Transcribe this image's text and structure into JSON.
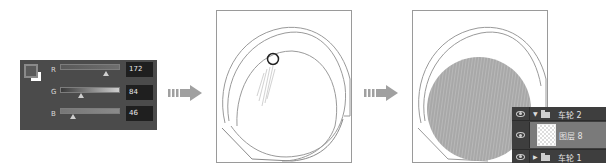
{
  "color_panel": {
    "channels": [
      {
        "label": "R",
        "value": "172",
        "thumb_pct": 0.76
      },
      {
        "label": "G",
        "value": "84",
        "thumb_pct": 0.36
      },
      {
        "label": "B",
        "value": "46",
        "thumb_pct": 0.22
      }
    ],
    "foreground_color": "#ac542e",
    "background_color": "#ffffff"
  },
  "arrows": [
    {
      "icon": "arrow-right-icon"
    },
    {
      "icon": "arrow-right-icon"
    }
  ],
  "canvas_before": {
    "cursor": "brush-circle-cursor"
  },
  "canvas_after": {
    "fill": "pencil-hatch-fill"
  },
  "layers_panel": {
    "rows": [
      {
        "type": "group",
        "expanded": true,
        "name": "车轮 2"
      },
      {
        "type": "layer",
        "selected": true,
        "name": "图层 8"
      },
      {
        "type": "group",
        "expanded": false,
        "name": "车轮 1"
      }
    ]
  },
  "colors": {
    "panel_bg": "#4b4b4b",
    "value_box_bg": "#1f1f1f",
    "arrow": "#9a9a9a",
    "layers_bg": "#3e3e3e",
    "layer_selected": "#7a7a7a"
  }
}
